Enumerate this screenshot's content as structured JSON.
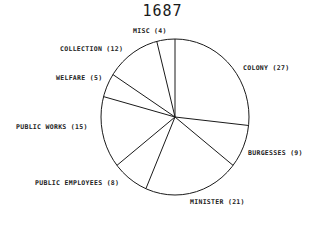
{
  "chart_data": {
    "type": "pie",
    "title": "1687",
    "start_angle_deg": 0,
    "direction": "clockwise",
    "slices": [
      {
        "label": "COLONY",
        "value": 27
      },
      {
        "label": "BURGESSES",
        "value": 9
      },
      {
        "label": "MINISTER",
        "value": 21
      },
      {
        "label": "PUBLIC EMPLOYEES",
        "value": 8
      },
      {
        "label": "PUBLIC WORKS",
        "value": 15
      },
      {
        "label": "WELFARE",
        "value": 5
      },
      {
        "label": "COLLECTION",
        "value": 12
      },
      {
        "label": "MISC",
        "value": 4
      }
    ],
    "labels_text": [
      "COLONY (27)",
      "BURGESSES (9)",
      "MINISTER (21)",
      "PUBLIC EMPLOYEES (8)",
      "PUBLIC WORKS (15)",
      "WELFARE (5)",
      "COLLECTION (12)",
      "MISC (4)"
    ],
    "legend": "none",
    "colors": {
      "stroke": "#1a1a1a",
      "fill": "#ffffff"
    }
  }
}
